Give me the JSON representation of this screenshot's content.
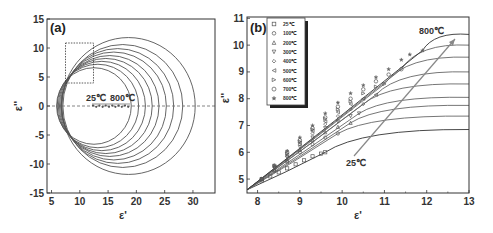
{
  "chart_data": [
    {
      "panel": "(a)",
      "type": "line",
      "title": "",
      "xlabel": "ε'",
      "ylabel": "ε''",
      "xlim": [
        4.2,
        33.9
      ],
      "ylim": [
        -15,
        15
      ],
      "xticks": [
        5,
        10,
        15,
        20,
        25,
        30
      ],
      "yticks": [
        -15,
        -10,
        -5,
        0,
        5,
        10,
        15
      ],
      "grid": false,
      "reference_line": {
        "y": 0,
        "style": "dashed"
      },
      "inset_box": {
        "x": [
          7.5,
          12.5
        ],
        "y": [
          4,
          11
        ],
        "style": "dotted"
      },
      "annotations": [
        {
          "text": "25℃",
          "x": 13.5,
          "y": 1.5
        },
        {
          "text": "800℃",
          "x": 18,
          "y": 1.5
        }
      ],
      "series": [
        {
          "name": "25℃",
          "center": [
            12.5,
            0
          ],
          "radius": 6.6
        },
        {
          "name": "100℃",
          "center": [
            13.2,
            0
          ],
          "radius": 7.2
        },
        {
          "name": "200℃",
          "center": [
            13.9,
            0
          ],
          "radius": 7.7
        },
        {
          "name": "300℃",
          "center": [
            14.6,
            0
          ],
          "radius": 8.2
        },
        {
          "name": "400℃",
          "center": [
            15.3,
            0
          ],
          "radius": 8.7
        },
        {
          "name": "500℃",
          "center": [
            16.0,
            0
          ],
          "radius": 9.3
        },
        {
          "name": "600℃",
          "center": [
            16.7,
            0
          ],
          "radius": 9.9
        },
        {
          "name": "700℃",
          "center": [
            17.6,
            0
          ],
          "radius": 10.6
        },
        {
          "name": "800℃",
          "center": [
            18.6,
            0
          ],
          "radius": 11.8
        }
      ]
    },
    {
      "panel": "(b)",
      "type": "scatter",
      "title": "",
      "xlabel": "ε'",
      "ylabel": "ε''",
      "xlim": [
        7.75,
        13
      ],
      "ylim": [
        4.48,
        11.05
      ],
      "xticks": [
        8,
        9,
        10,
        11,
        12,
        13
      ],
      "yticks": [
        5,
        6,
        7,
        8,
        9,
        10,
        11
      ],
      "grid": false,
      "legend_position": "upper left",
      "annotations": [
        {
          "text": "800℃",
          "x": 12.2,
          "y": 10.6
        },
        {
          "text": "25℃",
          "x": 10.3,
          "y": 5.2
        }
      ],
      "series": [
        {
          "name": "25℃",
          "marker": "square",
          "x": [
            8.1,
            8.3,
            8.5,
            8.7,
            8.9,
            9.1,
            9.3,
            9.5,
            9.6
          ],
          "y": [
            4.95,
            5.1,
            5.25,
            5.4,
            5.55,
            5.7,
            5.85,
            5.95,
            6.0
          ],
          "fit_end": [
            13,
            6.85
          ]
        },
        {
          "name": "100℃",
          "marker": "circle",
          "x": [
            8.1,
            8.4,
            8.7,
            9.0,
            9.3,
            9.6,
            9.9
          ],
          "y": [
            5.0,
            5.3,
            5.65,
            6.0,
            6.3,
            6.55,
            6.7
          ],
          "fit_end": [
            13,
            7.35
          ]
        },
        {
          "name": "200℃",
          "marker": "triangle-up",
          "x": [
            8.1,
            8.4,
            8.7,
            9.0,
            9.3,
            9.6,
            9.9,
            10.2
          ],
          "y": [
            5.0,
            5.35,
            5.7,
            6.1,
            6.45,
            6.75,
            6.95,
            7.1
          ],
          "fit_end": [
            13,
            7.75
          ]
        },
        {
          "name": "300℃",
          "marker": "triangle-down",
          "x": [
            8.1,
            8.4,
            8.7,
            9.0,
            9.3,
            9.6,
            9.9,
            10.2,
            10.4
          ],
          "y": [
            5.0,
            5.4,
            5.8,
            6.2,
            6.55,
            6.9,
            7.15,
            7.35,
            7.45
          ],
          "fit_end": [
            13,
            8.05
          ]
        },
        {
          "name": "400℃",
          "marker": "diamond",
          "x": [
            8.1,
            8.4,
            8.7,
            9.0,
            9.3,
            9.6,
            9.9,
            10.2,
            10.5
          ],
          "y": [
            5.0,
            5.45,
            5.85,
            6.3,
            6.7,
            7.05,
            7.35,
            7.6,
            7.8
          ],
          "fit_end": [
            13,
            8.55
          ]
        },
        {
          "name": "500℃",
          "marker": "triangle-left",
          "x": [
            8.1,
            8.4,
            8.7,
            9.0,
            9.3,
            9.6,
            9.9,
            10.2,
            10.5,
            10.8
          ],
          "y": [
            5.0,
            5.45,
            5.9,
            6.35,
            6.8,
            7.15,
            7.5,
            7.8,
            8.0,
            8.15
          ],
          "fit_end": [
            13,
            9.0
          ]
        },
        {
          "name": "600℃",
          "marker": "triangle-right",
          "x": [
            8.1,
            8.4,
            8.7,
            9.0,
            9.3,
            9.6,
            9.9,
            10.2,
            10.5,
            10.8,
            11.0
          ],
          "y": [
            5.0,
            5.5,
            5.95,
            6.4,
            6.85,
            7.25,
            7.6,
            7.9,
            8.2,
            8.45,
            8.55
          ],
          "fit_end": [
            13,
            9.55
          ]
        },
        {
          "name": "700℃",
          "marker": "hexagon",
          "x": [
            8.1,
            8.4,
            8.7,
            9.0,
            9.3,
            9.6,
            9.9,
            10.2,
            10.5,
            10.8,
            11.1,
            11.4
          ],
          "y": [
            5.0,
            5.5,
            6.0,
            6.45,
            6.9,
            7.3,
            7.7,
            8.0,
            8.35,
            8.65,
            8.9,
            9.1
          ],
          "fit_end": [
            13,
            10.0
          ]
        },
        {
          "name": "800℃",
          "marker": "star",
          "x": [
            8.1,
            8.4,
            8.7,
            9.0,
            9.3,
            9.6,
            9.9,
            10.2,
            10.5,
            10.8,
            11.1,
            11.4,
            11.6,
            11.9
          ],
          "y": [
            5.0,
            5.5,
            6.05,
            6.55,
            7.0,
            7.45,
            7.85,
            8.2,
            8.5,
            8.8,
            9.1,
            9.45,
            9.65,
            9.8
          ],
          "fit_end": [
            13,
            10.4
          ]
        }
      ],
      "trend_arrow": {
        "from": [
          10.0,
          5.9
        ],
        "to": [
          12.4,
          10.2
        ]
      }
    }
  ],
  "panel_a": {
    "label": "(a)",
    "xlabel": "ε'",
    "ylabel": "ε''",
    "ann_low": "25℃",
    "ann_high": "800℃",
    "xticks": [
      "5",
      "10",
      "15",
      "20",
      "25",
      "30"
    ],
    "yticks": [
      "15",
      "10",
      "5",
      "0",
      "-5",
      "-10",
      "-15"
    ]
  },
  "panel_b": {
    "label": "(b)",
    "xlabel": "ε'",
    "ylabel": "ε''",
    "ann_low": "25℃",
    "ann_high": "800℃",
    "xticks": [
      "8",
      "9",
      "10",
      "11",
      "12",
      "13"
    ],
    "yticks": [
      "11",
      "10",
      "9",
      "8",
      "7",
      "6",
      "5"
    ],
    "legend": [
      "25℃",
      "100℃",
      "200℃",
      "300℃",
      "400℃",
      "500℃",
      "600℃",
      "700℃",
      "800℃"
    ]
  },
  "colors": {
    "axis": "#333333",
    "curve": "#555555",
    "marker": "#666666",
    "arrow": "#888888"
  }
}
